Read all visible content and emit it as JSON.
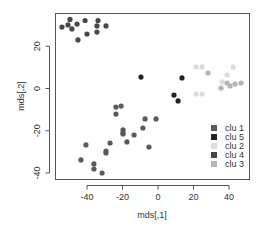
{
  "chart_data": {
    "type": "scatter",
    "title": "",
    "xlabel": "mds[,1]",
    "ylabel": "mds[,2]",
    "xlim": [
      -57,
      51
    ],
    "ylim": [
      -43,
      36
    ],
    "xticks": [
      -40,
      -20,
      0,
      20,
      40
    ],
    "yticks": [
      -40,
      -20,
      0,
      20
    ],
    "grid": false,
    "legend_position": "bottom-right",
    "legend": [
      {
        "label": "clu 1",
        "color": "#5a5a5a"
      },
      {
        "label": "clu 5",
        "color": "#222222"
      },
      {
        "label": "clu 2",
        "color": "#dcdcdc"
      },
      {
        "label": "clu 4",
        "color": "#474747"
      },
      {
        "label": "clu 3",
        "color": "#b4b4b4"
      }
    ],
    "series": [
      {
        "name": "clu 4",
        "color": "#474747",
        "points": [
          [
            -49.6,
            32.7
          ],
          [
            -41.1,
            32.2
          ],
          [
            -33.8,
            32.2
          ],
          [
            -54.1,
            29.1
          ],
          [
            -50.7,
            30.1
          ],
          [
            -48.5,
            28.2
          ],
          [
            -45.6,
            30.5
          ],
          [
            -34.4,
            29.6
          ],
          [
            -29.3,
            29.6
          ],
          [
            -34.4,
            26.7
          ],
          [
            -40.0,
            25.8
          ],
          [
            -45.1,
            23.0
          ]
        ]
      },
      {
        "name": "clu 1",
        "color": "#5a5a5a",
        "points": [
          [
            -23.7,
            -8.8
          ],
          [
            -20.8,
            -8.3
          ],
          [
            -23.7,
            -12.1
          ],
          [
            -7.3,
            -14.4
          ],
          [
            -1.1,
            -14.4
          ],
          [
            -19.7,
            -19.6
          ],
          [
            -19.7,
            -21.1
          ],
          [
            -19.7,
            -21.5
          ],
          [
            -8.5,
            -18.7
          ],
          [
            -13.5,
            -22.0
          ],
          [
            -17.5,
            -25.3
          ],
          [
            -27.0,
            -25.8
          ],
          [
            -40.6,
            -26.7
          ],
          [
            -5.1,
            -27.7
          ],
          [
            -29.3,
            -29.6
          ],
          [
            -29.3,
            -30.5
          ],
          [
            -43.4,
            -33.8
          ],
          [
            -36.1,
            -35.7
          ],
          [
            -36.1,
            -38.1
          ],
          [
            -31.5,
            -40.0
          ]
        ]
      },
      {
        "name": "clu 5",
        "color": "#222222",
        "points": [
          [
            -9.6,
            5.4
          ],
          [
            13.5,
            5.0
          ],
          [
            9.0,
            -3.1
          ],
          [
            11.3,
            -5.9
          ]
        ]
      },
      {
        "name": "clu 2",
        "color": "#dcdcdc",
        "points": [
          [
            24.8,
            10.2
          ],
          [
            21.4,
            10.2
          ],
          [
            42.3,
            10.2
          ],
          [
            38.9,
            6.4
          ],
          [
            36.1,
            3.1
          ],
          [
            21.4,
            -2.6
          ],
          [
            24.8,
            -2.6
          ]
        ]
      },
      {
        "name": "clu 3",
        "color": "#b4b4b4",
        "points": [
          [
            28.2,
            7.3
          ],
          [
            38.9,
            2.6
          ],
          [
            43.4,
            2.1
          ],
          [
            46.8,
            2.6
          ],
          [
            35.5,
            0.2
          ],
          [
            40.6,
            1.2
          ]
        ]
      }
    ]
  }
}
